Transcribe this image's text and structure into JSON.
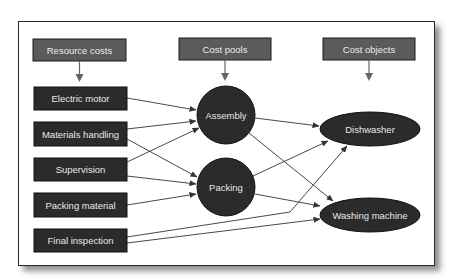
{
  "colors": {
    "header_fill": "#5a5a5a",
    "node_fill": "#2b2b2b",
    "stroke": "#1a1a1a",
    "arrow": "#333333",
    "node_text": "#e6e6e6",
    "frame_border": "#2a2a2a"
  },
  "headers": {
    "resource_costs": "Resource costs",
    "cost_pools": "Cost pools",
    "cost_objects": "Cost objects"
  },
  "resources": [
    {
      "id": "electric-motor",
      "label": "Electric motor"
    },
    {
      "id": "materials-handling",
      "label": "Materials handling"
    },
    {
      "id": "supervision",
      "label": "Supervision"
    },
    {
      "id": "packing-material",
      "label": "Packing material"
    },
    {
      "id": "final-inspection",
      "label": "Final inspection"
    }
  ],
  "cost_pools": [
    {
      "id": "assembly",
      "label": "Assembly"
    },
    {
      "id": "packing",
      "label": "Packing"
    }
  ],
  "cost_objects": [
    {
      "id": "dishwasher",
      "label": "Dishwasher"
    },
    {
      "id": "washing-machine",
      "label": "Washing machine"
    }
  ],
  "edges": [
    {
      "from": "Resource costs",
      "to": "Electric motor"
    },
    {
      "from": "Cost pools",
      "to": "Assembly"
    },
    {
      "from": "Cost objects",
      "to": "Dishwasher"
    },
    {
      "from": "Electric motor",
      "to": "Assembly"
    },
    {
      "from": "Materials handling",
      "to": "Assembly"
    },
    {
      "from": "Materials handling",
      "to": "Packing"
    },
    {
      "from": "Supervision",
      "to": "Assembly"
    },
    {
      "from": "Supervision",
      "to": "Packing"
    },
    {
      "from": "Packing material",
      "to": "Packing"
    },
    {
      "from": "Final inspection",
      "to": "Dishwasher"
    },
    {
      "from": "Final inspection",
      "to": "Washing machine"
    },
    {
      "from": "Assembly",
      "to": "Dishwasher"
    },
    {
      "from": "Assembly",
      "to": "Washing machine"
    },
    {
      "from": "Packing",
      "to": "Dishwasher"
    },
    {
      "from": "Packing",
      "to": "Washing machine"
    }
  ]
}
